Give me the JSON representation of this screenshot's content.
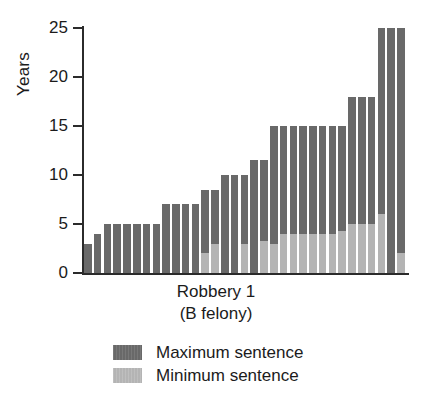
{
  "chart_data": {
    "type": "bar",
    "title": "",
    "subtitle": "",
    "xlabel": "Robbery 1",
    "xlabel_line2": "(B felony)",
    "ylabel": "Years",
    "ylim": [
      0,
      25
    ],
    "yticks": [
      0,
      5,
      10,
      15,
      20,
      25
    ],
    "ytick_labels": [
      "0",
      "5",
      "10",
      "15",
      "20",
      "25"
    ],
    "grid": false,
    "legend_position": "below-plot",
    "stacked": true,
    "note": "Each bar is one sentence observation; dark segment is the maximum sentence, light segment at the base is the minimum sentence.",
    "series": [
      {
        "name": "Maximum sentence",
        "color": "#696969",
        "values": [
          3,
          4,
          5,
          5,
          5,
          5,
          5,
          5,
          7,
          7,
          7,
          7,
          8.5,
          8.5,
          10,
          10,
          10,
          11.5,
          11.5,
          15,
          15,
          15,
          15,
          15,
          15,
          15,
          15,
          18,
          18,
          18,
          25,
          25,
          25
        ]
      },
      {
        "name": "Minimum sentence",
        "color": "#b4b4b4",
        "values": [
          0,
          0,
          0,
          0,
          0,
          0,
          0,
          0,
          0,
          0,
          0,
          0,
          2,
          3,
          0,
          0,
          3,
          0,
          3.3,
          3,
          4,
          4,
          4,
          4,
          4,
          4,
          4.3,
          5,
          5,
          5,
          6,
          0,
          2
        ]
      }
    ],
    "categories": [
      "1",
      "2",
      "3",
      "4",
      "5",
      "6",
      "7",
      "8",
      "9",
      "10",
      "11",
      "12",
      "13",
      "14",
      "15",
      "16",
      "17",
      "18",
      "19",
      "20",
      "21",
      "22",
      "23",
      "24",
      "25",
      "26",
      "27",
      "28",
      "29",
      "30",
      "31",
      "32",
      "33"
    ]
  },
  "legend": {
    "items": [
      {
        "label": "Maximum sentence",
        "swatch": "max"
      },
      {
        "label": "Minimum sentence",
        "swatch": "min"
      }
    ]
  }
}
